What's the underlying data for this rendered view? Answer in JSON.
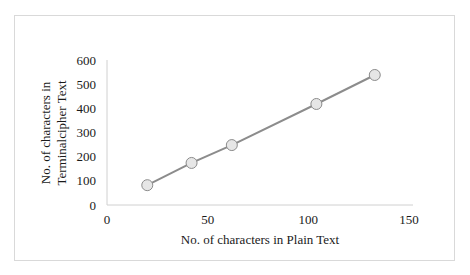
{
  "chart_data": {
    "type": "line",
    "title": "",
    "xlabel": "No. of characters in Plain Text",
    "ylabel": [
      "No. of characters in",
      "Terminalcipher Text"
    ],
    "xlim": [
      0,
      150
    ],
    "ylim": [
      0,
      600
    ],
    "x_ticks": [
      0,
      50,
      100,
      150
    ],
    "y_ticks": [
      0,
      100,
      200,
      300,
      400,
      500,
      600
    ],
    "grid": false,
    "legend": null,
    "series": [
      {
        "name": "Terminalcipher Text",
        "x": [
          20,
          42,
          62,
          104,
          133
        ],
        "y": [
          82,
          174,
          248,
          418,
          538
        ],
        "color": "#8c8c8c",
        "marker": "circle",
        "marker_fill": "#e6e6e6",
        "marker_edge": "#8c8c8c"
      }
    ]
  },
  "colors": {
    "frame_border": "#d9d9d9",
    "axis_line": "#d0d0d0",
    "series_line": "#8c8c8c"
  }
}
